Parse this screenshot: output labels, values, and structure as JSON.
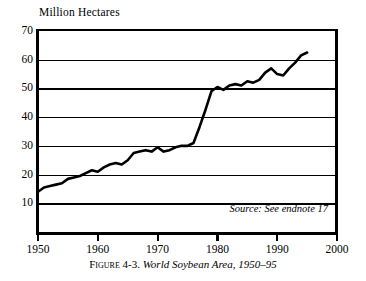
{
  "figure": {
    "caption_prefix": "Figure 4-3.",
    "caption_title": "World Soybean Area, 1950–95",
    "source_note": "Source: See endnote 17"
  },
  "axes": {
    "y_label": "Million Hectares",
    "y_ticks": [
      70,
      60,
      50,
      40,
      30,
      20,
      10
    ],
    "x_ticks": [
      1950,
      1960,
      1970,
      1980,
      1990,
      2000
    ],
    "y_min": 0,
    "y_max": 70,
    "x_min": 1950,
    "x_max": 2000
  },
  "colors": {
    "ink": "#000000",
    "paper": "#ffffff",
    "grid": "#000000"
  },
  "chart_data": {
    "type": "line",
    "title": "World Soybean Area, 1950–95",
    "subtitle": "",
    "xlabel": "",
    "ylabel": "Million Hectares",
    "xlim": [
      1950,
      2000
    ],
    "ylim": [
      0,
      70
    ],
    "grid": true,
    "legend": null,
    "annotations": [
      "Source: See endnote 17"
    ],
    "x": [
      1950,
      1951,
      1952,
      1953,
      1954,
      1955,
      1956,
      1957,
      1958,
      1959,
      1960,
      1961,
      1962,
      1963,
      1964,
      1965,
      1966,
      1967,
      1968,
      1969,
      1970,
      1971,
      1972,
      1973,
      1974,
      1975,
      1976,
      1977,
      1978,
      1979,
      1980,
      1981,
      1982,
      1983,
      1984,
      1985,
      1986,
      1987,
      1988,
      1989,
      1990,
      1991,
      1992,
      1993,
      1994,
      1995
    ],
    "values": [
      14.0,
      15.5,
      16.0,
      16.5,
      17.0,
      18.5,
      19.0,
      19.5,
      20.5,
      21.5,
      21.0,
      22.5,
      23.5,
      24.0,
      23.5,
      25.0,
      27.5,
      28.0,
      28.5,
      28.0,
      29.5,
      28.0,
      28.5,
      29.5,
      30.0,
      30.0,
      31.0,
      36.5,
      42.5,
      49.0,
      50.5,
      49.5,
      51.0,
      51.5,
      51.0,
      52.5,
      52.0,
      53.0,
      55.5,
      57.0,
      55.0,
      54.5,
      57.0,
      59.0,
      61.5,
      62.5
    ],
    "series": [
      {
        "name": "World soybean area",
        "unit": "million hectares",
        "values": [
          14.0,
          15.5,
          16.0,
          16.5,
          17.0,
          18.5,
          19.0,
          19.5,
          20.5,
          21.5,
          21.0,
          22.5,
          23.5,
          24.0,
          23.5,
          25.0,
          27.5,
          28.0,
          28.5,
          28.0,
          29.5,
          28.0,
          28.5,
          29.5,
          30.0,
          30.0,
          31.0,
          36.5,
          42.5,
          49.0,
          50.5,
          49.5,
          51.0,
          51.5,
          51.0,
          52.5,
          52.0,
          53.0,
          55.5,
          57.0,
          55.0,
          54.5,
          57.0,
          59.0,
          61.5,
          62.5
        ]
      }
    ]
  }
}
